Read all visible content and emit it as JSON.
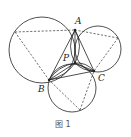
{
  "figure": {
    "caption": "图 1",
    "points": {
      "A": {
        "label": "A",
        "x": 75,
        "y": 30
      },
      "B": {
        "label": "B",
        "x": 49,
        "y": 80
      },
      "C": {
        "label": "C",
        "x": 94,
        "y": 71
      },
      "P": {
        "label": "P",
        "x": 75,
        "y": 63
      }
    },
    "outer_vertices": {
      "left": {
        "x": 15,
        "y": 32
      },
      "right": {
        "x": 118,
        "y": 38
      },
      "bottom": {
        "x": 80,
        "y": 110
      }
    },
    "circles": [
      {
        "name": "circle-ABX",
        "cx": 42,
        "cy": 50,
        "r": 33
      },
      {
        "name": "circle-ACY",
        "cx": 98,
        "cy": 49,
        "r": 23
      },
      {
        "name": "circle-BCZ",
        "cx": 72,
        "cy": 88,
        "r": 24
      }
    ]
  }
}
